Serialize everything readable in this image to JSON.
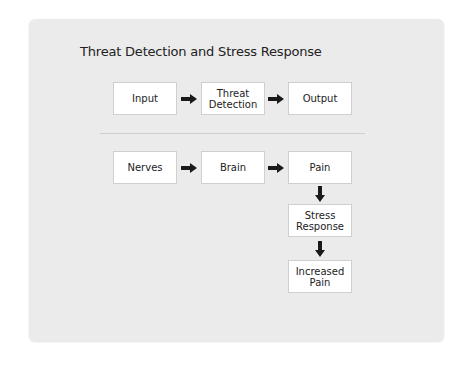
{
  "diagram": {
    "title": "Threat Detection and Stress Response",
    "row1": [
      {
        "label": "Input"
      },
      {
        "label": "Threat\nDetection"
      },
      {
        "label": "Output"
      }
    ],
    "row2": [
      {
        "label": "Nerves"
      },
      {
        "label": "Brain"
      },
      {
        "label": "Pain"
      }
    ],
    "column": [
      {
        "label": "Stress\nResponse"
      },
      {
        "label": "Increased\nPain"
      }
    ],
    "colors": {
      "panel_bg": "#ebebeb",
      "box_bg": "#ffffff",
      "box_border": "#cfcfcf",
      "arrow": "#1a1a1a",
      "text": "#222222"
    }
  }
}
